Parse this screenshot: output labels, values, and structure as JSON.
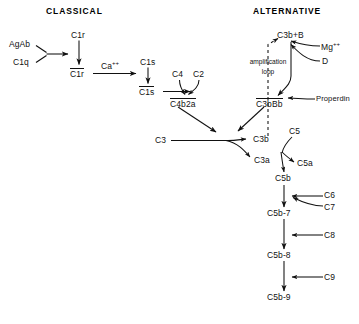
{
  "figure": {
    "headers": {
      "classical": "CLASSICAL",
      "alternative": "ALTERNATIVE"
    },
    "annotations": {
      "amplification_line1": "amplification",
      "amplification_line2": "loop"
    },
    "nodes": {
      "agab": "AgAb",
      "c1q": "C1q",
      "c1r_inactive": "C1r",
      "c1r_active": "C1r",
      "ca_ion": "Ca",
      "ca_ion_charge": "++",
      "c1s_inactive": "C1s",
      "c1s_active": "C1s",
      "c4": "C4",
      "c2": "C2",
      "c4b2a": "C4b2a",
      "c3b_plus_b": "C3b+B",
      "mg_ion": "Mg",
      "mg_ion_charge": "++",
      "factor_d": "D",
      "properdin": "Properdin",
      "c3bbb": "C3bBb",
      "c3": "C3",
      "c3b": "C3b",
      "c3a": "C3a",
      "c5": "C5",
      "c5a": "C5a",
      "c5b": "C5b",
      "c6": "C6",
      "c7": "C7",
      "c5b7": "C5b-7",
      "c8": "C8",
      "c5b8": "C5b-8",
      "c9": "C9",
      "c5b9": "C5b-9"
    },
    "colors": {
      "background": "#ffffff",
      "ink": "#111111",
      "header_ink": "#000000"
    }
  }
}
